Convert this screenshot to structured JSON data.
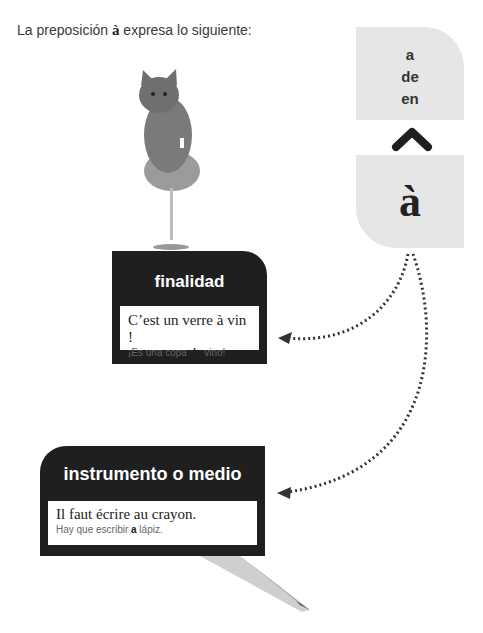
{
  "intro": {
    "before": "La preposición ",
    "prep": "à",
    "after": " expresa lo siguiente:"
  },
  "comparison": {
    "spanish_words": [
      "a",
      "de",
      "en"
    ],
    "french_word": "à",
    "arrow_icon": "chevron-up-icon"
  },
  "usages": [
    {
      "title": "finalidad",
      "french": "C’est un verre à vin !",
      "spanish_before": "¡Es una copa ",
      "spanish_bold": "de",
      "spanish_after": " vino!",
      "illustration": "kitten-in-wine-glass"
    },
    {
      "title": "instrumento o medio",
      "french": "Il faut écrire au crayon.",
      "spanish_before": "Hay que escribir ",
      "spanish_bold": "a",
      "spanish_after": " lápiz.",
      "illustration": "pencil"
    }
  ],
  "colors": {
    "dark_box": "#1f1f1f",
    "light_card": "#e6e6e6",
    "arrow": "#333333"
  }
}
